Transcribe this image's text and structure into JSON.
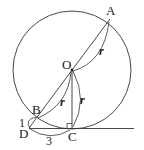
{
  "diagram": {
    "type": "geometry-circle-tangent",
    "colors": {
      "stroke": "#333333",
      "text": "#1a1a1a",
      "background": "#ffffff"
    },
    "points": {
      "A": {
        "label": "A"
      },
      "O": {
        "label": "O"
      },
      "B": {
        "label": "B"
      },
      "C": {
        "label": "C"
      },
      "D": {
        "label": "D"
      }
    },
    "measures": {
      "OA": "r",
      "OB": "r",
      "OC": "r",
      "DB": "1",
      "DC": "3"
    },
    "annotations": {
      "right_angle_at": "C"
    }
  }
}
